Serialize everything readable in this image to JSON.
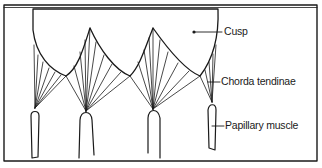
{
  "figure": {
    "labels": {
      "cusp": "Cusp",
      "chorda_tendinae": "Chorda tendinae",
      "papillary_muscle": "Papillary muscle"
    },
    "colors": {
      "line": "#1a1a1a",
      "background": "#ffffff"
    }
  }
}
